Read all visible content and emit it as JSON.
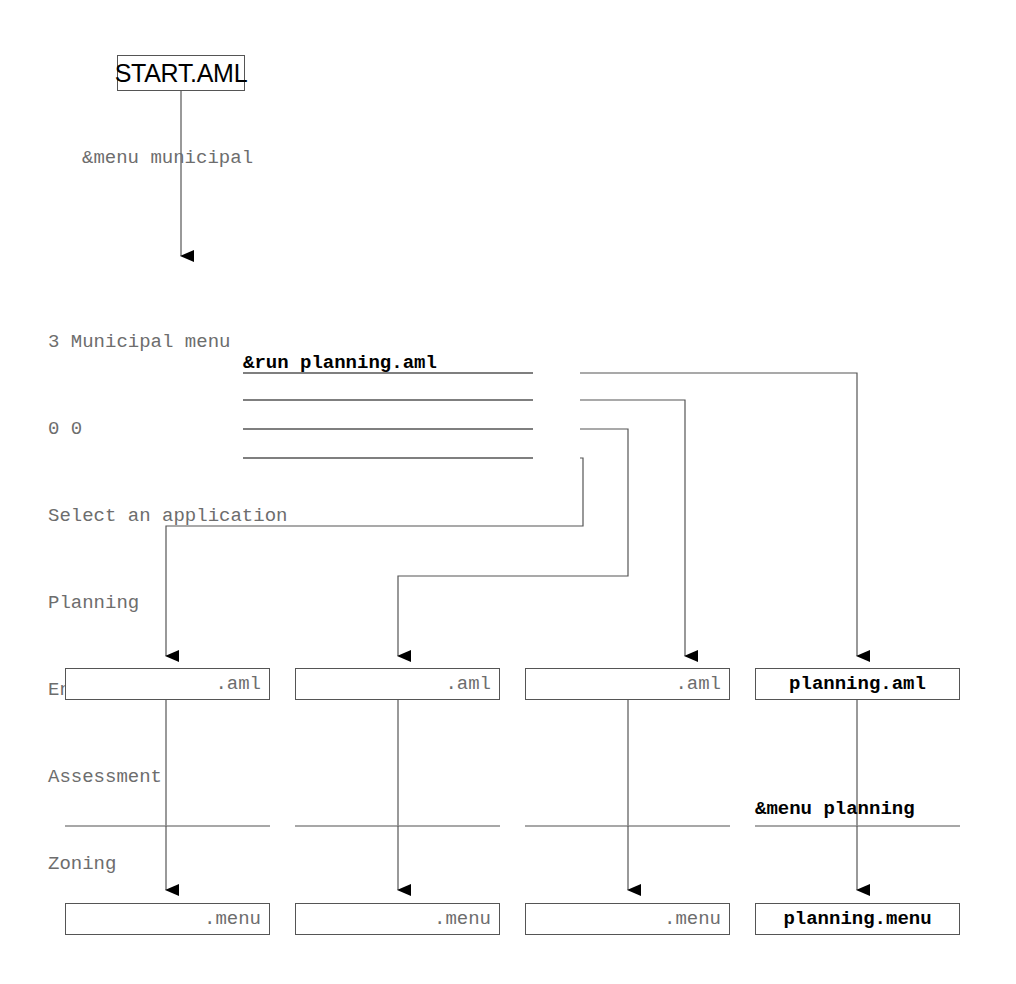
{
  "diagram": {
    "title_node": {
      "label": "START.AML"
    },
    "root_edge_label": "&menu municipal",
    "menu_panel": {
      "lines": [
        "3 Municipal menu",
        "0 0",
        "Select an application"
      ],
      "options": [
        {
          "label": "Planning",
          "command": "&run planning.aml"
        },
        {
          "label": "Engineering",
          "command": ""
        },
        {
          "label": "Assessment",
          "command": ""
        },
        {
          "label": "Zoning",
          "command": ""
        }
      ]
    },
    "aml_row": [
      {
        "label": ".aml",
        "style": "generic"
      },
      {
        "label": ".aml",
        "style": "generic"
      },
      {
        "label": ".aml",
        "style": "generic"
      },
      {
        "label": "planning.aml",
        "style": "highlight"
      }
    ],
    "menu_row": [
      {
        "label": ".menu",
        "style": "generic"
      },
      {
        "label": ".menu",
        "style": "generic"
      },
      {
        "label": ".menu",
        "style": "generic"
      },
      {
        "label": "planning.menu",
        "style": "highlight"
      }
    ],
    "second_edge_label": "&menu planning",
    "colors": {
      "line": "#555555",
      "generic_text": "#6d6d6d",
      "highlight_text": "#000000",
      "background": "#ffffff"
    }
  }
}
